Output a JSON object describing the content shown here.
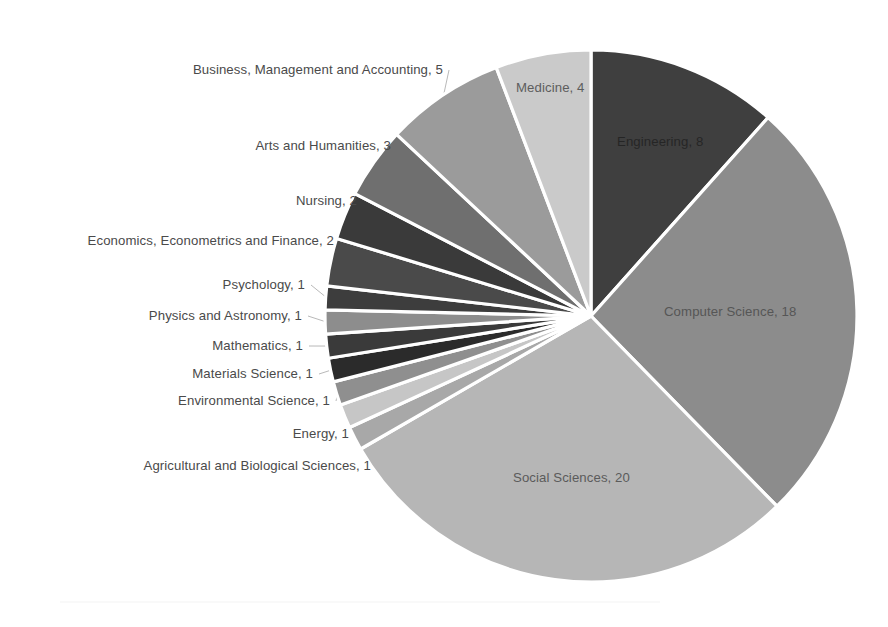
{
  "chart_data": {
    "type": "pie",
    "title": "",
    "subtitle": "",
    "xlabel": "",
    "ylabel": "",
    "legend_position": "none",
    "grid": false,
    "total": 69,
    "units": "documents",
    "label_format": "name, value",
    "start_angle_deg": 0,
    "direction": "clockwise",
    "categories": [
      "Engineering",
      "Computer Science",
      "Social Sciences",
      "Agricultural and Biological Sciences",
      "Energy",
      "Environmental Science",
      "Materials Science",
      "Mathematics",
      "Physics and Astronomy",
      "Psychology",
      "Economics, Econometrics and Finance",
      "Nursing",
      "Arts and Humanities",
      "Business, Management and Accounting",
      "Medicine"
    ],
    "values": [
      8,
      18,
      20,
      1,
      1,
      1,
      1,
      1,
      1,
      1,
      2,
      2,
      3,
      5,
      4
    ],
    "colors": [
      "#3f3f3f",
      "#8c8c8c",
      "#b6b6b6",
      "#a8a8a8",
      "#c6c6c6",
      "#8f8f8f",
      "#2b2b2b",
      "#3a3a3a",
      "#8d8d8d",
      "#3d3d3d",
      "#4a4a4a",
      "#3a3a3a",
      "#6f6f6f",
      "#9b9b9b",
      "#cacaca"
    ],
    "slices": [
      {
        "label": "Engineering, 8",
        "name": "Engineering",
        "value": 8,
        "color": "#3f3f3f",
        "label_placement": "inside",
        "label_tone": "dark"
      },
      {
        "label": "Computer Science, 18",
        "name": "Computer Science",
        "value": 18,
        "color": "#8c8c8c",
        "label_placement": "inside",
        "label_tone": "light"
      },
      {
        "label": "Social Sciences, 20",
        "name": "Social Sciences",
        "value": 20,
        "color": "#b6b6b6",
        "label_placement": "inside",
        "label_tone": "light"
      },
      {
        "label": "Agricultural and Biological Sciences, 1",
        "name": "Agricultural and Biological Sciences",
        "value": 1,
        "color": "#a8a8a8",
        "label_placement": "outside",
        "label_tone": "light"
      },
      {
        "label": "Energy, 1",
        "name": "Energy",
        "value": 1,
        "color": "#c6c6c6",
        "label_placement": "outside",
        "label_tone": "light"
      },
      {
        "label": "Environmental Science, 1",
        "name": "Environmental Science",
        "value": 1,
        "color": "#8f8f8f",
        "label_placement": "outside",
        "label_tone": "light"
      },
      {
        "label": "Materials Science, 1",
        "name": "Materials Science",
        "value": 1,
        "color": "#2b2b2b",
        "label_placement": "outside",
        "label_tone": "light"
      },
      {
        "label": "Mathematics, 1",
        "name": "Mathematics",
        "value": 1,
        "color": "#3a3a3a",
        "label_placement": "outside",
        "label_tone": "light"
      },
      {
        "label": "Physics and Astronomy, 1",
        "name": "Physics and Astronomy",
        "value": 1,
        "color": "#8d8d8d",
        "label_placement": "outside",
        "label_tone": "light"
      },
      {
        "label": "Psychology, 1",
        "name": "Psychology",
        "value": 1,
        "color": "#3d3d3d",
        "label_placement": "outside",
        "label_tone": "light"
      },
      {
        "label": "Economics, Econometrics and Finance, 2",
        "name": "Economics, Econometrics and Finance",
        "value": 2,
        "color": "#4a4a4a",
        "label_placement": "outside",
        "label_tone": "light"
      },
      {
        "label": "Nursing, 2",
        "name": "Nursing",
        "value": 2,
        "color": "#3a3a3a",
        "label_placement": "outside",
        "label_tone": "light"
      },
      {
        "label": "Arts and Humanities, 3",
        "name": "Arts and Humanities",
        "value": 3,
        "color": "#6f6f6f",
        "label_placement": "outside",
        "label_tone": "light"
      },
      {
        "label": "Business, Management and Accounting, 5",
        "name": "Business, Management and Accounting",
        "value": 5,
        "color": "#9b9b9b",
        "label_placement": "outside",
        "label_tone": "light"
      },
      {
        "label": "Medicine, 4",
        "name": "Medicine",
        "value": 4,
        "color": "#cacaca",
        "label_placement": "inside",
        "label_tone": "light"
      }
    ]
  },
  "geometry": {
    "cx": 591,
    "cy": 316,
    "r": 266
  },
  "inside_labels": [
    {
      "key": "Engineering, 8",
      "x": 617,
      "y": 142,
      "tone": "dark"
    },
    {
      "key": "Computer Science, 18",
      "x": 664,
      "y": 312,
      "tone": "light"
    },
    {
      "key": "Social Sciences, 20",
      "x": 513,
      "y": 478,
      "tone": "light"
    },
    {
      "key": "Medicine, 4",
      "x": 516,
      "y": 88,
      "tone": "light"
    }
  ],
  "outside_labels": [
    {
      "key": "Business, Management and Accounting, 5",
      "right": 443,
      "y": 70
    },
    {
      "key": "Arts and Humanities, 3",
      "right": 391,
      "y": 146
    },
    {
      "key": "Nursing, 2",
      "right": 357,
      "y": 201
    },
    {
      "key": "Economics, Econometrics and Finance, 2",
      "right": 334,
      "y": 241
    },
    {
      "key": "Psychology, 1",
      "right": 305,
      "y": 285
    },
    {
      "key": "Physics and Astronomy, 1",
      "right": 302,
      "y": 316
    },
    {
      "key": "Mathematics, 1",
      "right": 303,
      "y": 346
    },
    {
      "key": "Materials Science, 1",
      "right": 313,
      "y": 374
    },
    {
      "key": "Environmental Science, 1",
      "right": 330,
      "y": 401
    },
    {
      "key": "Energy, 1",
      "right": 349,
      "y": 434
    },
    {
      "key": "Agricultural and Biological Sciences, 1",
      "right": 371,
      "y": 466
    }
  ]
}
